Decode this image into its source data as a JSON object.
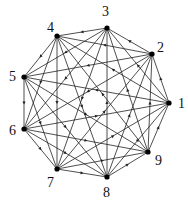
{
  "diagram": {
    "type": "complete-directed-graph",
    "nodes": [
      {
        "id": "1",
        "x": 169,
        "y": 103,
        "lx": 178,
        "ly": 97
      },
      {
        "id": "2",
        "x": 152,
        "y": 54,
        "lx": 157,
        "ly": 41
      },
      {
        "id": "3",
        "x": 107,
        "y": 28,
        "lx": 102,
        "ly": 5
      },
      {
        "id": "4",
        "x": 57,
        "y": 36,
        "lx": 47,
        "ly": 21
      },
      {
        "id": "5",
        "x": 24,
        "y": 77,
        "lx": 9,
        "ly": 70
      },
      {
        "id": "6",
        "x": 24,
        "y": 129,
        "lx": 9,
        "ly": 124
      },
      {
        "id": "7",
        "x": 57,
        "y": 169,
        "lx": 47,
        "ly": 176
      },
      {
        "id": "8",
        "x": 107,
        "y": 177,
        "lx": 103,
        "ly": 186
      },
      {
        "id": "9",
        "x": 148,
        "y": 152,
        "lx": 155,
        "ly": 154
      }
    ],
    "edge_rule": "i->j for all pairs, direction i to i+k (mod 9), k=1..4",
    "colors": {
      "line": "#222222",
      "node": "#000000"
    }
  }
}
